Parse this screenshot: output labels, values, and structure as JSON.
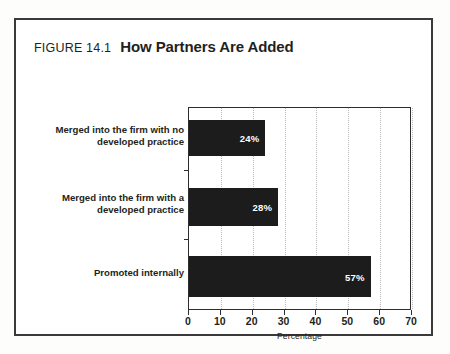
{
  "figure": {
    "number_label": "FIGURE 14.1",
    "title": "How Partners Are Added",
    "border_color": "#3a3a3a",
    "background_color": "#ffffff"
  },
  "chart_data": {
    "type": "bar",
    "orientation": "horizontal",
    "title": "How Partners Are Added",
    "xlabel": "Percentage",
    "ylabel": "",
    "categories": [
      "Merged into the firm with no developed practice",
      "Merged into the firm with a developed practice",
      "Promoted internally"
    ],
    "category_lines": [
      [
        "Merged into the firm with no",
        "developed practice"
      ],
      [
        "Merged into the firm with a",
        "developed practice"
      ],
      [
        "Promoted internally"
      ]
    ],
    "values": [
      24,
      28,
      57
    ],
    "value_labels": [
      "24%",
      "28%",
      "57%"
    ],
    "xlim": [
      0,
      70
    ],
    "xticks": [
      0,
      10,
      20,
      30,
      40,
      50,
      60,
      70
    ],
    "xtick_labels": [
      "0",
      "10",
      "20",
      "30",
      "40",
      "50",
      "60",
      "70"
    ],
    "grid": "vertical-dotted",
    "legend": null,
    "bar_color": "#1c1c1c",
    "value_label_color": "#ffffff",
    "gridline_color": "#b9b9b9",
    "axis_color": "#2e2e2e"
  }
}
